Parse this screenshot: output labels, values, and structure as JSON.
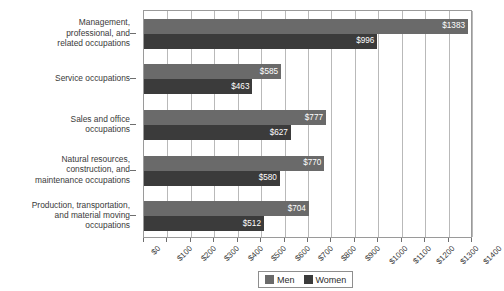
{
  "chart_data": {
    "type": "bar",
    "orientation": "horizontal",
    "title": "",
    "xlabel": "",
    "ylabel": "",
    "xlim": [
      0,
      1400
    ],
    "xticks": [
      "$0",
      "$100",
      "$200",
      "$300",
      "$400",
      "$500",
      "$600",
      "$700",
      "$800",
      "$900",
      "$1000",
      "$1100",
      "$1200",
      "$1300",
      "$1400"
    ],
    "xtick_values": [
      0,
      100,
      200,
      300,
      400,
      500,
      600,
      700,
      800,
      900,
      1000,
      1100,
      1200,
      1300,
      1400
    ],
    "grid": true,
    "grid_axis": "x",
    "legend_position": "bottom-right",
    "categories": [
      "Management,\nprofessional, and\nrelated occupations",
      "Service occupations",
      "Sales and office\noccupations",
      "Natural resources,\nconstruction, and\nmaintenance occupations",
      "Production, transportation,\nand material moving\noccupations"
    ],
    "series": [
      {
        "name": "Men",
        "color": "#6a6a6a",
        "values": [
          1383,
          585,
          777,
          770,
          704
        ],
        "labels": [
          "$1383",
          "$585",
          "$777",
          "$770",
          "$704"
        ]
      },
      {
        "name": "Women",
        "color": "#3b3b3b",
        "values": [
          996,
          463,
          627,
          580,
          512
        ],
        "labels": [
          "$996",
          "$463",
          "$627",
          "$580",
          "$512"
        ]
      }
    ]
  },
  "legend": {
    "items": [
      {
        "label": "Men",
        "color": "#6a6a6a"
      },
      {
        "label": "Women",
        "color": "#3b3b3b"
      }
    ]
  }
}
